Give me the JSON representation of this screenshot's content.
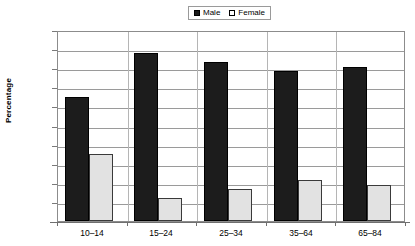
{
  "chart_data": {
    "type": "bar",
    "title": "",
    "subtitle": "",
    "xlabel": "",
    "ylabel": "Percentage",
    "categories": [
      "10–14",
      "15–24",
      "25–34",
      "35–64",
      "65–84"
    ],
    "series": [
      {
        "name": "Male",
        "values": [
          65.0,
          88.0,
          83.0,
          78.3,
          80.5
        ],
        "color": "#1c1c1c"
      },
      {
        "name": "Female",
        "values": [
          35.0,
          12.3,
          16.5,
          21.5,
          19.0
        ],
        "color": "#e2e2e2"
      }
    ],
    "ylim": [
      0,
      100
    ],
    "ytick_step": 10,
    "ytick_labels": [
      "100.0%",
      "90.0%",
      "80.0%",
      "70.0%",
      "60.0%",
      "50.0%",
      "40.0%",
      "30.0%",
      "20.0%",
      "10.0%",
      "0.0%"
    ],
    "grid": true,
    "grid_axis": "y",
    "legend_position": "top-center",
    "legend_entries": [
      "Male",
      "Female"
    ],
    "value_labels_shown": false
  },
  "axis": {
    "y_title": "Percentage",
    "y_ticks": [
      "100.0%",
      "90.0%",
      "80.0%",
      "70.0%",
      "60.0%",
      "50.0%",
      "40.0%",
      "30.0%",
      "20.0%",
      "10.0%",
      "0.0%"
    ],
    "x_ticks": [
      "10–14",
      "15–24",
      "25–34",
      "35–64",
      "65–84"
    ]
  },
  "legend": {
    "items": [
      {
        "label": "Male",
        "swatch": "filled-square-icon"
      },
      {
        "label": "Female",
        "swatch": "empty-square-icon"
      }
    ]
  },
  "colors": {
    "male_bar": "#1c1c1c",
    "female_bar": "#e2e2e2",
    "gridline": "#9a9a9a",
    "frame": "#8c8c8c",
    "background": "#ffffff"
  }
}
